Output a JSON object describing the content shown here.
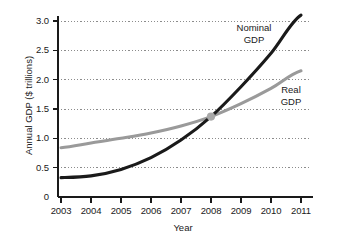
{
  "chart_data": {
    "type": "line",
    "title": "",
    "xlabel": "Year",
    "ylabel": "Annual GDP ($ trillions)",
    "x": [
      2003,
      2004,
      2005,
      2006,
      2007,
      2008,
      2009,
      2010,
      2011
    ],
    "xticklabels": [
      "2003",
      "2004",
      "2005",
      "2006",
      "2007",
      "2008",
      "2009",
      "2010",
      "2011"
    ],
    "yticklabels": [
      "3.0",
      "2.5",
      "2.0",
      "1.5",
      "1.0",
      "0.5",
      "0"
    ],
    "ytickvalues": [
      3.0,
      2.5,
      2.0,
      1.5,
      1.0,
      0.5,
      0
    ],
    "xlim": [
      2002.8,
      2011.15
    ],
    "ylim": [
      0,
      3.2
    ],
    "grid": "horizontal-dotted",
    "legend_position": "inline-annotations",
    "series": [
      {
        "name": "Nominal GDP",
        "color": "#1a1a1a",
        "values": [
          0.33,
          0.36,
          0.47,
          0.67,
          0.97,
          1.37,
          1.88,
          2.45,
          3.1
        ]
      },
      {
        "name": "Real GDP",
        "color": "#9a9a9a",
        "values": [
          0.84,
          0.92,
          1.0,
          1.09,
          1.21,
          1.37,
          1.59,
          1.85,
          2.15
        ]
      }
    ],
    "annotations": [
      {
        "name": "intersection-marker",
        "x": 2008,
        "y": 1.37,
        "color": "#a8a8a8",
        "shape": "circle"
      }
    ]
  },
  "labels": {
    "y_axis_title": "Annual GDP ($ trillions)",
    "x_axis_title": "Year",
    "nominal_line1": "Nominal",
    "nominal_line2": "GDP",
    "real_line1": "Real",
    "real_line2": "GDP"
  },
  "colors": {
    "nominal": "#1a1a1a",
    "real": "#9a9a9a",
    "grid": "#8c8c8c",
    "axis": "#1a1a1a",
    "marker": "#a8a8a8",
    "background": "#ffffff"
  }
}
